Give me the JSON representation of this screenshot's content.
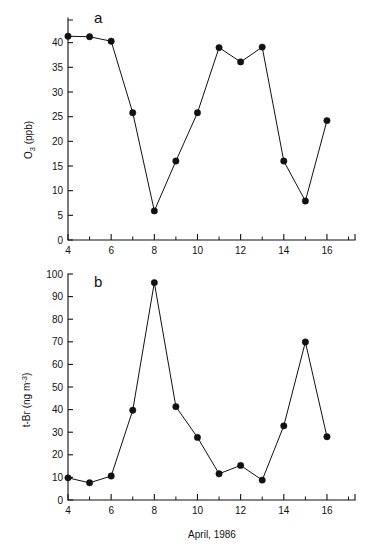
{
  "figure": {
    "background_color": "#ffffff",
    "ink_color": "#111111",
    "xlabel": "April, 1986"
  },
  "chart_data": [
    {
      "type": "line",
      "panel_label": "a",
      "title": "",
      "xlabel": "April, 1986",
      "ylabel": "O3 (ppb)",
      "ylabel_parts": {
        "main": "O",
        "sub": "3",
        "unit": " (ppb)"
      },
      "x": [
        4,
        5,
        6,
        7,
        8,
        9,
        10,
        11,
        12,
        13,
        14,
        15,
        16
      ],
      "values": [
        41.3,
        41.2,
        40.3,
        25.8,
        5.9,
        16.0,
        25.8,
        39.0,
        36.1,
        39.1,
        16.0,
        7.9,
        24.2
      ],
      "xlim": [
        4,
        17.3
      ],
      "ylim": [
        0,
        45
      ],
      "xticks": [
        4,
        6,
        8,
        10,
        12,
        14,
        16
      ],
      "xticks_minor": [
        5,
        7,
        9,
        11,
        13,
        15,
        17
      ],
      "xtick_labels": [
        "4",
        "6",
        "8",
        "10",
        "12",
        "14",
        "16"
      ],
      "yticks": [
        0,
        5,
        10,
        15,
        20,
        25,
        30,
        35,
        40
      ],
      "ytick_labels": [
        "0",
        "5",
        "10",
        "15",
        "20",
        "25",
        "30",
        "35",
        "40"
      ],
      "grid": false,
      "legend": false,
      "marker": "filled-circle"
    },
    {
      "type": "line",
      "panel_label": "b",
      "title": "",
      "xlabel": "April, 1986",
      "ylabel": "t-Br (ng m-3)",
      "ylabel_parts": {
        "main": "t-Br (ng m",
        "sup": "-3",
        "close": ")"
      },
      "x": [
        4,
        5,
        6,
        7,
        8,
        9,
        10,
        11,
        12,
        13,
        14,
        15,
        16
      ],
      "values": [
        9.8,
        7.6,
        10.6,
        39.7,
        96.2,
        41.3,
        27.7,
        11.6,
        15.3,
        8.8,
        32.8,
        69.9,
        28.0
      ],
      "xlim": [
        4,
        17.3
      ],
      "ylim": [
        0,
        100
      ],
      "xticks": [
        4,
        6,
        8,
        10,
        12,
        14,
        16
      ],
      "xticks_minor": [
        5,
        7,
        9,
        11,
        13,
        15,
        17
      ],
      "xtick_labels": [
        "4",
        "6",
        "8",
        "10",
        "12",
        "14",
        "16"
      ],
      "yticks": [
        0,
        10,
        20,
        30,
        40,
        50,
        60,
        70,
        80,
        90,
        100
      ],
      "ytick_labels": [
        "0",
        "10",
        "20",
        "30",
        "40",
        "50",
        "60",
        "70",
        "80",
        "90",
        "100"
      ],
      "grid": false,
      "legend": false,
      "marker": "filled-circle"
    }
  ]
}
